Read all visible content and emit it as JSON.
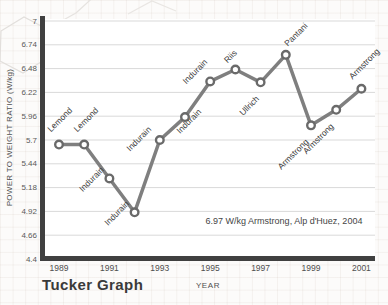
{
  "chart_data": {
    "type": "line",
    "title": "Tucker Graph",
    "xlabel": "YEAR",
    "ylabel": "POWER TO WEIGHT RATIO (W/kg)",
    "annotation": "6.97 W/kg Armstrong, Alp d'Huez, 2004",
    "x": [
      1989,
      1990,
      1991,
      1992,
      1993,
      1994,
      1995,
      1996,
      1997,
      1998,
      1999,
      2000,
      2001
    ],
    "series": [
      {
        "name": "power_to_weight_ratio",
        "values": [
          5.65,
          5.65,
          5.28,
          4.91,
          5.7,
          5.95,
          6.34,
          6.47,
          6.33,
          6.63,
          5.86,
          6.03,
          6.26
        ]
      }
    ],
    "point_labels": [
      "Lemond",
      "Lemond",
      "Indurain",
      "Indurain",
      "Indurain",
      "Indurain",
      "Indurain",
      "Riis",
      "Ullrich",
      "Pantani",
      "Armstrong",
      "Armstrong",
      "Armstrong"
    ],
    "x_ticks": [
      "1989",
      "1991",
      "1993",
      "1995",
      "1997",
      "1999",
      "2001"
    ],
    "y_ticks": [
      "7",
      "6.74",
      "6.48",
      "6.22",
      "5.96",
      "5.7",
      "5.44",
      "5.18",
      "4.92",
      "4.66",
      "4.4"
    ],
    "ylim": [
      4.4,
      7
    ],
    "xlim": [
      1989,
      2001
    ],
    "grid": "horizontal",
    "legend": "none",
    "marker": "open-circle",
    "colors": {
      "line": "#7f7f7f",
      "marker_fill": "#ffffff",
      "marker_stroke": "#6a6a6a",
      "axis": "#404040",
      "gridline": "#d9d9d9",
      "point_label_text": "#3b3b3b",
      "tick_text": "#595959",
      "title_text": "#3a3a3a"
    }
  }
}
